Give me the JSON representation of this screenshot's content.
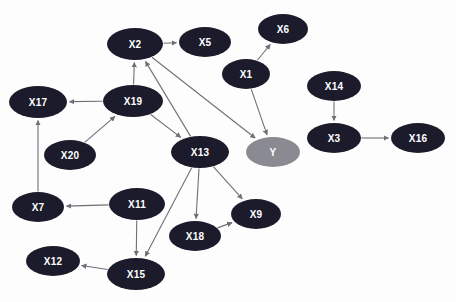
{
  "graph": {
    "title": "Directed acyclic graph",
    "background_color": "#fdfdfd",
    "default_node_color": "#1b1b2b",
    "target_node_color": "#8a8a93",
    "node_label_color": "#ffffff",
    "edge_color": "#6f6f78",
    "node_rx": 27,
    "node_ry": 15,
    "nodes": [
      {
        "id": "X2",
        "label": "X2",
        "x": 135,
        "y": 44,
        "color": "#1b1b2b",
        "rx": 28,
        "ry": 16
      },
      {
        "id": "X5",
        "label": "X5",
        "x": 205,
        "y": 42,
        "color": "#1b1b2b",
        "rx": 26,
        "ry": 15
      },
      {
        "id": "X6",
        "label": "X6",
        "x": 283,
        "y": 29,
        "color": "#1b1b2b",
        "rx": 25,
        "ry": 15
      },
      {
        "id": "X1",
        "label": "X1",
        "x": 246,
        "y": 74,
        "color": "#1b1b2b",
        "rx": 24,
        "ry": 15
      },
      {
        "id": "X17",
        "label": "X17",
        "x": 38,
        "y": 102,
        "color": "#1b1b2b",
        "rx": 29,
        "ry": 16
      },
      {
        "id": "X19",
        "label": "X19",
        "x": 133,
        "y": 101,
        "color": "#1b1b2b",
        "rx": 30,
        "ry": 16
      },
      {
        "id": "X14",
        "label": "X14",
        "x": 334,
        "y": 86,
        "color": "#1b1b2b",
        "rx": 27,
        "ry": 15
      },
      {
        "id": "X3",
        "label": "X3",
        "x": 334,
        "y": 138,
        "color": "#1b1b2b",
        "rx": 27,
        "ry": 15
      },
      {
        "id": "X16",
        "label": "X16",
        "x": 418,
        "y": 138,
        "color": "#1b1b2b",
        "rx": 27,
        "ry": 15
      },
      {
        "id": "X20",
        "label": "X20",
        "x": 70,
        "y": 155,
        "color": "#1b1b2b",
        "rx": 26,
        "ry": 15
      },
      {
        "id": "X13",
        "label": "X13",
        "x": 200,
        "y": 152,
        "color": "#1b1b2b",
        "rx": 29,
        "ry": 16
      },
      {
        "id": "Y",
        "label": "Y",
        "x": 273,
        "y": 152,
        "color": "#8a8a93",
        "rx": 27,
        "ry": 15
      },
      {
        "id": "X7",
        "label": "X7",
        "x": 38,
        "y": 207,
        "color": "#1b1b2b",
        "rx": 26,
        "ry": 15
      },
      {
        "id": "X11",
        "label": "X11",
        "x": 137,
        "y": 204,
        "color": "#1b1b2b",
        "rx": 28,
        "ry": 16
      },
      {
        "id": "X18",
        "label": "X18",
        "x": 195,
        "y": 236,
        "color": "#1b1b2b",
        "rx": 26,
        "ry": 15
      },
      {
        "id": "X9",
        "label": "X9",
        "x": 256,
        "y": 214,
        "color": "#1b1b2b",
        "rx": 25,
        "ry": 15
      },
      {
        "id": "X12",
        "label": "X12",
        "x": 53,
        "y": 261,
        "color": "#1b1b2b",
        "rx": 27,
        "ry": 15
      },
      {
        "id": "X15",
        "label": "X15",
        "x": 136,
        "y": 274,
        "color": "#1b1b2b",
        "rx": 29,
        "ry": 16
      }
    ],
    "edges": [
      {
        "from": "X2",
        "to": "X5"
      },
      {
        "from": "X2",
        "to": "Y"
      },
      {
        "from": "X13",
        "to": "X2"
      },
      {
        "from": "X19",
        "to": "X2"
      },
      {
        "from": "X19",
        "to": "X17"
      },
      {
        "from": "X19",
        "to": "X13"
      },
      {
        "from": "X20",
        "to": "X19"
      },
      {
        "from": "X7",
        "to": "X17"
      },
      {
        "from": "X1",
        "to": "X6"
      },
      {
        "from": "X1",
        "to": "Y"
      },
      {
        "from": "X14",
        "to": "X3"
      },
      {
        "from": "X3",
        "to": "X16"
      },
      {
        "from": "X11",
        "to": "X7"
      },
      {
        "from": "X11",
        "to": "X15"
      },
      {
        "from": "X13",
        "to": "X15"
      },
      {
        "from": "X13",
        "to": "X18"
      },
      {
        "from": "X13",
        "to": "X9"
      },
      {
        "from": "X18",
        "to": "X9"
      },
      {
        "from": "X15",
        "to": "X12"
      }
    ]
  }
}
